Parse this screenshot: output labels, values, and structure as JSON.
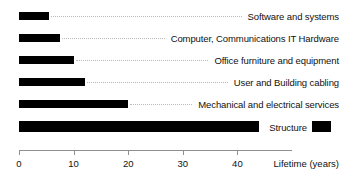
{
  "chart_data": {
    "type": "bar",
    "orientation": "horizontal",
    "title": "",
    "xlabel": "Lifetime (years)",
    "ylabel": "",
    "xlim": [
      0,
      50
    ],
    "grid": false,
    "legend": "none",
    "bar_color": "#000000",
    "leader_color": "#b9b9b9",
    "axis_color": "#8f8f8f",
    "xticks": [
      0,
      10,
      20,
      30,
      40
    ],
    "xtick_labels": [
      "0",
      "10",
      "20",
      "30",
      "40"
    ],
    "categories": [
      "Software and systems",
      "Computer, Communications IT Hardware",
      "Office furniture and equipment",
      "User and Building cabling",
      "Mechanical and electrical services",
      "Structure"
    ],
    "values": [
      5.5,
      7.5,
      10,
      12,
      20,
      44
    ],
    "annotations": {
      "structure_continues": true,
      "structure_continuation_note": "Structure bar resumes as a short segment at the far right edge, past its label"
    }
  },
  "axis": {
    "title": "Lifetime (years)",
    "ticks": [
      {
        "label": "0",
        "value": 0
      },
      {
        "label": "10",
        "value": 10
      },
      {
        "label": "20",
        "value": 20
      },
      {
        "label": "30",
        "value": 30
      },
      {
        "label": "40",
        "value": 40
      }
    ]
  },
  "rows": [
    {
      "label": "Software and systems",
      "value": 5.5
    },
    {
      "label": "Computer, Communications IT Hardware",
      "value": 7.5
    },
    {
      "label": "Office furniture and equipment",
      "value": 10
    },
    {
      "label": "User and Building cabling",
      "value": 12
    },
    {
      "label": "Mechanical and electrical services",
      "value": 20
    },
    {
      "label": "Structure",
      "value": 44
    }
  ]
}
